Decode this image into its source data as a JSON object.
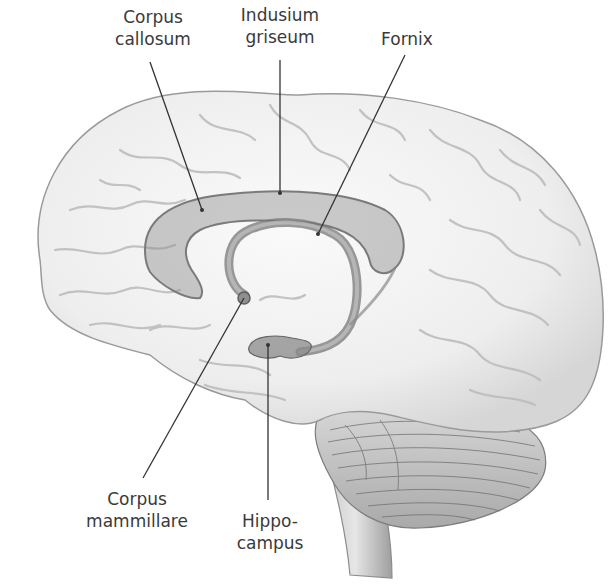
{
  "figure": {
    "colors": {
      "background": "#ffffff",
      "brain_fill": "#f1f1f1",
      "sulcus_stroke": "#b9b9b9",
      "highlight_fill": "#9a9a9a",
      "leader_line": "#333333",
      "label_text": "#3a3a3a"
    }
  },
  "labels": {
    "corpus_callosum": {
      "line1": "Corpus",
      "line2": "callosum"
    },
    "indusium_griseum": {
      "line1": "Indusium",
      "line2": "griseum"
    },
    "fornix": {
      "line1": "Fornix"
    },
    "corpus_mammillare": {
      "line1": "Corpus",
      "line2": "mammillare"
    },
    "hippocampus": {
      "line1": "Hippo-",
      "line2": "campus"
    }
  }
}
